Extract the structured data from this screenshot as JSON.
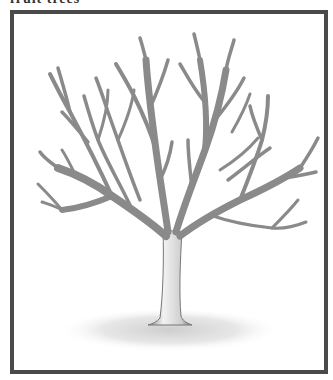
{
  "caption": "fruit trees",
  "illustration": {
    "subject": "pruned-deciduous-tree",
    "style": "pencil-drawing",
    "frame_color": "#4a4a4a",
    "branch_color": "#8a8a8a",
    "ground_color": "#d8d8d8"
  }
}
